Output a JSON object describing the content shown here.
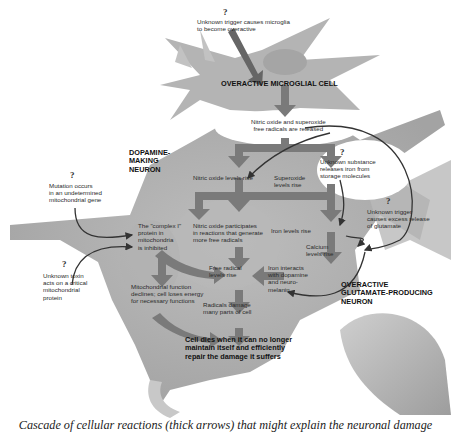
{
  "diagram": {
    "caption": "Cascade of cellular reactions (thick arrows) that might explain the neuronal damage",
    "cells": {
      "microglial": "OVERACTIVE MICROGLIAL CELL",
      "dopamine_1": "DOPAMINE-",
      "dopamine_2": "MAKING",
      "dopamine_3": "NEURON",
      "glutamate_1": "OVERACTIVE",
      "glutamate_2": "GLUTAMATE-PRODUCING",
      "glutamate_3": "NEURON"
    },
    "triggers": [
      {
        "mark": "?",
        "lines": [
          "Unknown trigger causes microglia",
          "to become overactive"
        ]
      },
      {
        "mark": "?",
        "lines": [
          "Mutation occurs",
          "in an undetermined",
          "mitochondrial gene"
        ]
      },
      {
        "mark": "?",
        "lines": [
          "Unknown toxin",
          "acts on a critical",
          "mitochondrial",
          "protein"
        ]
      },
      {
        "mark": "?",
        "lines": [
          "Unknown substance",
          "releases iron from",
          "storage molecules"
        ]
      },
      {
        "mark": "?",
        "lines": [
          "Unknown trigger",
          "causes excess release",
          "of glutamate"
        ]
      }
    ],
    "steps": {
      "radicals_released": [
        "Nitric oxide and superoxide",
        "free radicals are released"
      ],
      "nitric_rise": [
        "Nitric oxide levels rise"
      ],
      "superoxide_rise": [
        "Superoxide",
        "levels rise"
      ],
      "complex_i": [
        "The \"complex I\"",
        "protein in",
        "mitochondria",
        "is inhibited"
      ],
      "nitric_participates": [
        "Nitric oxide participates",
        "in reactions that generate",
        "more free radicals"
      ],
      "iron_rise": [
        "Iron levels rise"
      ],
      "calcium_rise": [
        "Calcium",
        "levels rise"
      ],
      "free_radical_rise": [
        "Free radical",
        "levels rise"
      ],
      "iron_interacts": [
        "Iron interacts",
        "with dopamine",
        "and neuro-",
        "melanin"
      ],
      "mito_declines": [
        "Mitochondrial function",
        "declines; cell loses energy",
        "for necessary functions"
      ],
      "radicals_damage": [
        "Radicals damage",
        "many parts of cell"
      ],
      "cell_dies": [
        "Cell dies when it can no longer",
        "maintain itself and efficiently",
        "repair the damage it suffers"
      ]
    },
    "colors": {
      "cell_fill": "#a9a9a9",
      "arrow": "#7a7a7a",
      "thin_arrow": "#333333",
      "bubble": "#ffffff"
    }
  }
}
